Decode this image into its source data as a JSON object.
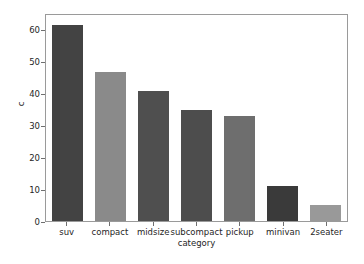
{
  "chart_data": {
    "type": "bar",
    "title": "",
    "xlabel": "category",
    "ylabel": "c",
    "categories": [
      "suv",
      "compact",
      "midsize",
      "subcompact",
      "pickup",
      "minivan",
      "2seater"
    ],
    "values": [
      62,
      47,
      41,
      35,
      33,
      11,
      5
    ],
    "bar_colors": [
      "#434343",
      "#8a8a8a",
      "#4f4f4f",
      "#4d4d4d",
      "#6e6e6e",
      "#3a3a3a",
      "#999999"
    ],
    "ylim": [
      0,
      65
    ],
    "yticks": [
      0,
      10,
      20,
      30,
      40,
      50,
      60
    ],
    "ytick_labels": [
      "0",
      "10",
      "20",
      "30",
      "40",
      "50",
      "60"
    ],
    "grid": false,
    "legend": "none",
    "background_color": "#ffffff",
    "axes_edge_color": "#9a9a9a",
    "tick_color": "#6f6f6f",
    "text_color": "#262626"
  }
}
